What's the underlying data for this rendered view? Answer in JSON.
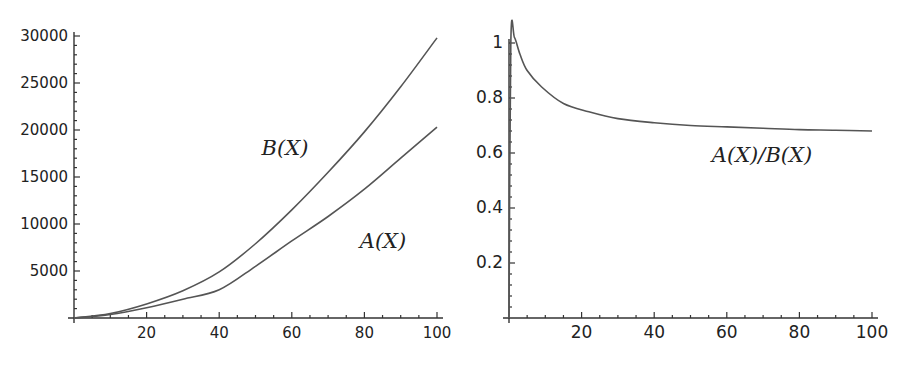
{
  "chart_data": [
    {
      "type": "line",
      "title": "",
      "xlabel": "",
      "ylabel": "",
      "xlim": [
        0,
        100
      ],
      "ylim": [
        0,
        30000
      ],
      "grid": false,
      "x_ticks": [
        20,
        40,
        60,
        80,
        100
      ],
      "y_ticks": [
        5000,
        10000,
        15000,
        20000,
        25000,
        30000
      ],
      "x_tick_labels": [
        "20",
        "40",
        "60",
        "80",
        "100"
      ],
      "y_tick_labels": [
        "5000",
        "10000",
        "15000",
        "20000",
        "25000",
        "30000"
      ],
      "x": [
        0,
        10,
        20,
        30,
        40,
        50,
        60,
        70,
        80,
        90,
        100
      ],
      "series": [
        {
          "name": "B(X)",
          "label": "B(X)",
          "values": [
            0,
            480,
            1500,
            2900,
            4900,
            7900,
            11500,
            15500,
            19800,
            24600,
            29800
          ]
        },
        {
          "name": "A(X)",
          "label": "A(X)",
          "values": [
            0,
            380,
            1100,
            2000,
            3000,
            5500,
            8200,
            10800,
            13700,
            17000,
            20300
          ]
        }
      ],
      "annotations": [
        "B(X)",
        "A(X)"
      ],
      "color": "#555555"
    },
    {
      "type": "line",
      "title": "",
      "xlabel": "",
      "ylabel": "",
      "xlim": [
        0,
        100
      ],
      "ylim": [
        0,
        1
      ],
      "grid": false,
      "x_ticks": [
        20,
        40,
        60,
        80,
        100
      ],
      "y_ticks": [
        0.2,
        0.4,
        0.6,
        0.8,
        1
      ],
      "x_tick_labels": [
        "20",
        "40",
        "60",
        "80",
        "100"
      ],
      "y_tick_labels": [
        "0.2",
        "0.4",
        "0.6",
        "0.8",
        "1"
      ],
      "x": [
        0,
        0.5,
        1.5,
        3,
        5,
        9,
        15,
        22,
        30,
        40,
        50,
        60,
        70,
        80,
        90,
        100
      ],
      "series": [
        {
          "name": "A(X)/B(X)",
          "label": "A(X)/B(X)",
          "values": [
            0,
            1.0,
            1.02,
            0.96,
            0.9,
            0.84,
            0.78,
            0.75,
            0.725,
            0.71,
            0.7,
            0.695,
            0.69,
            0.685,
            0.683,
            0.68
          ]
        }
      ],
      "annotations": [
        "A(X)/B(X)"
      ],
      "color": "#555555"
    }
  ],
  "labels": {
    "left_b": "B(X)",
    "left_a": "A(X)",
    "right_ratio": "A(X)/B(X)"
  }
}
